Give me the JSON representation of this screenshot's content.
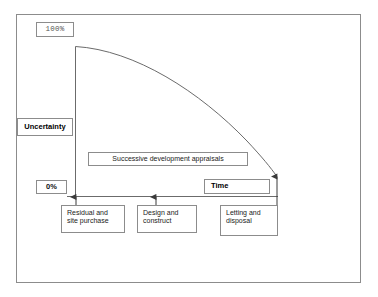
{
  "figure": {
    "kind": "uncertainty-over-time-diagram",
    "frame_border_color": "#8c8c8c",
    "line_color": "#6b6b6b",
    "background": "#ffffff"
  },
  "axes": {
    "y_axis_top_label": "100%",
    "y_axis_bottom_label": "0%",
    "y_axis_name": "Uncertainty",
    "x_axis_name": "Time"
  },
  "annotations": {
    "appraisals_band": "Successive development appraisals"
  },
  "stages": [
    {
      "id": "stage-1",
      "label": "Residual and\nsite purchase"
    },
    {
      "id": "stage-2",
      "label": "Design and\nconstruct"
    },
    {
      "id": "stage-3",
      "label": "Letting and\ndisposal"
    }
  ],
  "chart_data": {
    "type": "line",
    "title": "",
    "subtitle": "",
    "xlabel": "Time",
    "ylabel": "Uncertainty",
    "xlim": [
      0,
      1
    ],
    "ylim": [
      0,
      100
    ],
    "ytick_labels": [
      "0%",
      "100%"
    ],
    "xtick_labels": [],
    "grid": false,
    "legend": false,
    "annotations": [
      "Successive development appraisals",
      "Residual and site purchase",
      "Design and construct",
      "Letting and disposal"
    ],
    "series": [
      {
        "name": "Uncertainty",
        "x": [
          0.0,
          0.1,
          0.2,
          0.3,
          0.4,
          0.5,
          0.6,
          0.7,
          0.8,
          0.9,
          1.0
        ],
        "values": [
          100,
          98,
          95,
          90,
          84,
          76,
          66,
          55,
          42,
          27,
          10
        ]
      }
    ]
  }
}
